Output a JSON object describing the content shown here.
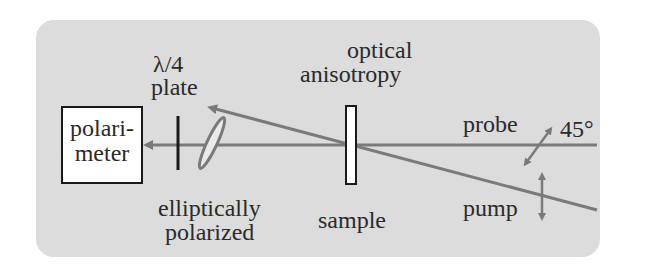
{
  "diagram": {
    "background_color": "#dcdcdc",
    "beam_color": "#7a7a7a",
    "labels": {
      "polarimeter": "polari-\nmeter",
      "polarimeter_line1": "polari-",
      "polarimeter_line2": "meter",
      "waveplate_line1": "λ/4",
      "waveplate_line2": "plate",
      "anisotropy_line1": "optical",
      "anisotropy_line2": "anisotropy",
      "elliptical_line1": "elliptically",
      "elliptical_line2": "polarized",
      "sample": "sample",
      "probe": "probe",
      "pump": "pump",
      "angle": "45°"
    }
  }
}
